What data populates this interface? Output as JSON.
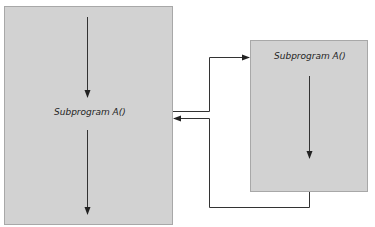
{
  "diagram": {
    "caller_box": {
      "label": "Subprogram A()"
    },
    "called_box": {
      "label": "Subprogram A()"
    },
    "colors": {
      "box_fill": "#d2d2d2",
      "box_border": "#a8a8a8",
      "line": "#333333"
    }
  }
}
